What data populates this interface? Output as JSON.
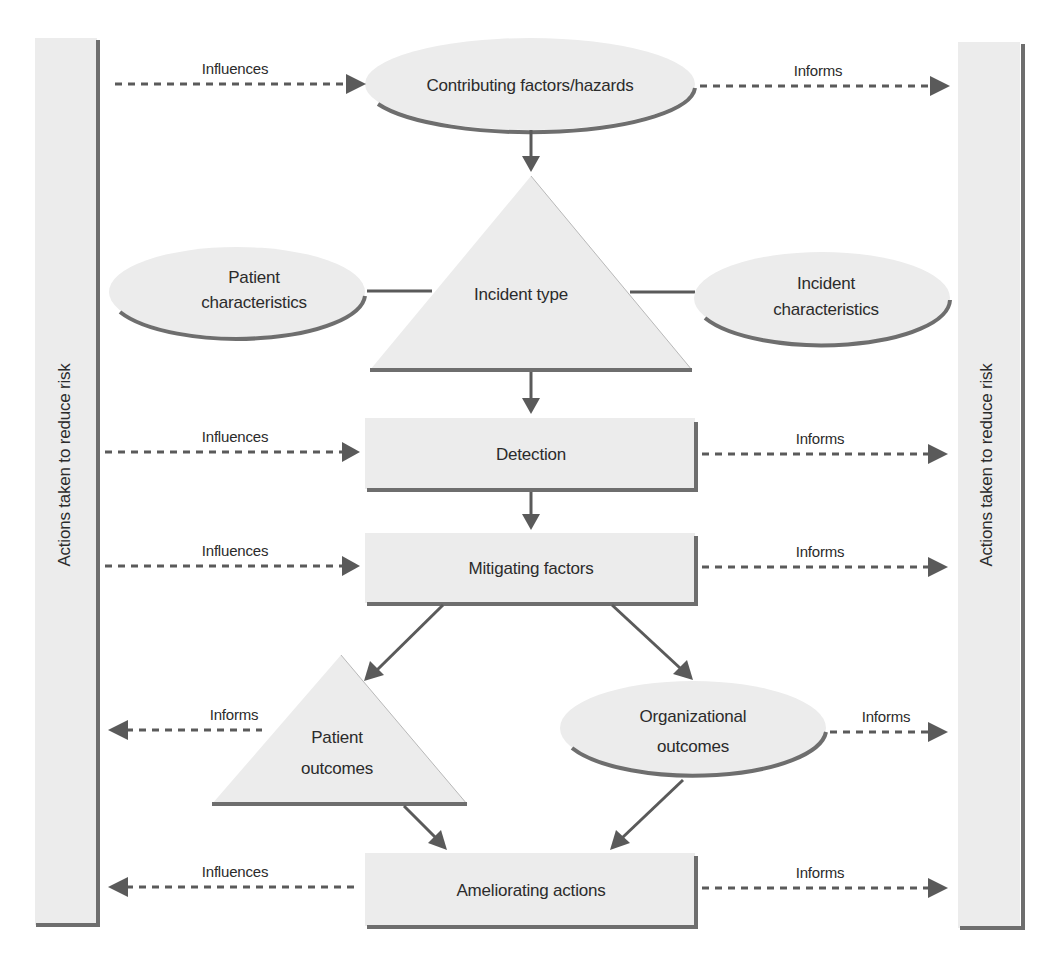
{
  "diagram": {
    "side_bars": {
      "left": {
        "label": "Actions taken to reduce risk"
      },
      "right": {
        "label": "Actions taken to reduce risk"
      }
    },
    "nodes": {
      "contributing_factors": {
        "shape": "ellipse",
        "label": "Contributing factors/hazards"
      },
      "patient_characteristics": {
        "shape": "ellipse",
        "line1": "Patient",
        "line2": "characteristics"
      },
      "incident_type": {
        "shape": "triangle",
        "label": "Incident type"
      },
      "incident_characteristics": {
        "shape": "ellipse",
        "line1": "Incident",
        "line2": "characteristics"
      },
      "detection": {
        "shape": "rectangle",
        "label": "Detection"
      },
      "mitigating_factors": {
        "shape": "rectangle",
        "label": "Mitigating factors"
      },
      "patient_outcomes": {
        "shape": "triangle",
        "line1": "Patient",
        "line2": "outcomes"
      },
      "organizational_outcomes": {
        "shape": "ellipse",
        "line1": "Organizational",
        "line2": "outcomes"
      },
      "ameliorating_actions": {
        "shape": "rectangle",
        "label": "Ameliorating actions"
      }
    },
    "edge_labels": {
      "contributing_in": "Influences",
      "contributing_out": "Informs",
      "detection_in": "Influences",
      "detection_out": "Informs",
      "mitigating_in": "Influences",
      "mitigating_out": "Informs",
      "patient_outcomes_out": "Informs",
      "organizational_outcomes_out": "Informs",
      "ameliorating_left": "Influences",
      "ameliorating_right": "Informs"
    },
    "edges": [
      {
        "from": "left-bar",
        "to": "Contributing factors/hazards",
        "style": "dashed",
        "label": "Influences"
      },
      {
        "from": "Contributing factors/hazards",
        "to": "right-bar",
        "style": "dashed",
        "label": "Informs"
      },
      {
        "from": "Contributing factors/hazards",
        "to": "Incident type",
        "style": "solid"
      },
      {
        "from": "Patient characteristics",
        "to": "Incident type",
        "style": "line"
      },
      {
        "from": "Incident type",
        "to": "Incident characteristics",
        "style": "line"
      },
      {
        "from": "Incident type",
        "to": "Detection",
        "style": "solid"
      },
      {
        "from": "left-bar",
        "to": "Detection",
        "style": "dashed",
        "label": "Influences"
      },
      {
        "from": "Detection",
        "to": "right-bar",
        "style": "dashed",
        "label": "Informs"
      },
      {
        "from": "Detection",
        "to": "Mitigating factors",
        "style": "solid"
      },
      {
        "from": "left-bar",
        "to": "Mitigating factors",
        "style": "dashed",
        "label": "Influences"
      },
      {
        "from": "Mitigating factors",
        "to": "right-bar",
        "style": "dashed",
        "label": "Informs"
      },
      {
        "from": "Mitigating factors",
        "to": "Patient outcomes",
        "style": "solid"
      },
      {
        "from": "Mitigating factors",
        "to": "Organizational outcomes",
        "style": "solid"
      },
      {
        "from": "Patient outcomes",
        "to": "left-bar",
        "style": "dashed",
        "label": "Informs"
      },
      {
        "from": "Organizational outcomes",
        "to": "right-bar",
        "style": "dashed",
        "label": "Informs"
      },
      {
        "from": "Patient outcomes",
        "to": "Ameliorating actions",
        "style": "solid"
      },
      {
        "from": "Organizational outcomes",
        "to": "Ameliorating actions",
        "style": "solid"
      },
      {
        "from": "Ameliorating actions",
        "to": "left-bar",
        "style": "dashed",
        "label": "Influences"
      },
      {
        "from": "Ameliorating actions",
        "to": "right-bar",
        "style": "dashed",
        "label": "Informs"
      }
    ],
    "colors": {
      "shape_fill": "#ececec",
      "shadow": "#6e6e6e",
      "arrow": "#5a5a5a",
      "text": "#2b2b2b"
    }
  }
}
